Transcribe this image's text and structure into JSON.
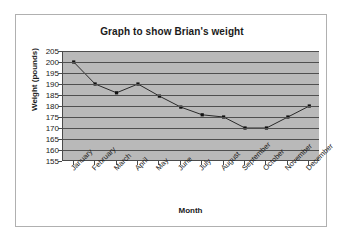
{
  "chart_data": {
    "type": "line",
    "title": "Graph to show Brian's weight",
    "xlabel": "Month",
    "ylabel": "Weight (pounds)",
    "categories": [
      "January",
      "February",
      "March",
      "April",
      "May",
      "June",
      "July",
      "August",
      "September",
      "October",
      "November",
      "December"
    ],
    "values": [
      200,
      190,
      186,
      190,
      184.5,
      179.5,
      176,
      175,
      170,
      170,
      175,
      180
    ],
    "series": [
      {
        "name": "Brian's weight",
        "values": [
          200,
          190,
          186,
          190,
          184.5,
          179.5,
          176,
          175,
          170,
          170,
          175,
          180
        ]
      }
    ],
    "ylim": [
      155,
      205
    ],
    "ytick_step": 5,
    "yticks": [
      205,
      200,
      195,
      190,
      185,
      180,
      175,
      170,
      165,
      160,
      155
    ],
    "grid": true,
    "legend": false,
    "legend_position": "none",
    "marker": "square",
    "colors": {
      "plot_background": "#b9b9b9",
      "gridline": "#4f4f4f",
      "axis": "#4a4a4a",
      "series_line": "#2a2a2a",
      "marker": "#111111",
      "frame_border": "#b0b0b0",
      "page_background": "#ffffff",
      "text": "#1a1a1a"
    }
  }
}
